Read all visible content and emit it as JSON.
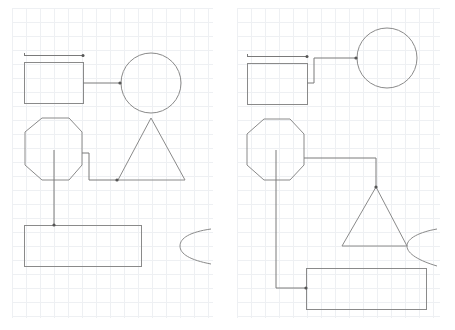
{
  "canvas": {
    "width": 455,
    "height": 330,
    "background": "#ffffff",
    "grid_color": "#eef0f3",
    "grid_spacing": 14,
    "stroke_color": "#8a8a8a"
  },
  "panels": [
    {
      "id": "left",
      "x": 0,
      "width": 227,
      "grid": {
        "x0": 12,
        "y0": 8,
        "x1": 213,
        "y1": 318
      },
      "shapes": [
        {
          "type": "line-marker",
          "name": "top-bar",
          "x1": 24,
          "y1": 55,
          "x2": 83,
          "y2": 55
        },
        {
          "type": "rect",
          "name": "rectangle-1",
          "x": 24,
          "y": 62,
          "w": 59,
          "h": 41
        },
        {
          "type": "circle",
          "name": "circle",
          "cx": 151,
          "cy": 83,
          "r": 30
        },
        {
          "type": "polygon",
          "name": "octagon",
          "points": "42,118 69,118 82,132 82,165 69,180 42,180 25,165 25,132"
        },
        {
          "type": "polygon",
          "name": "triangle",
          "points": "151,118 185,180 118,180"
        },
        {
          "type": "rect",
          "name": "rectangle-2",
          "x": 24,
          "y": 225,
          "w": 117,
          "h": 41
        },
        {
          "type": "arc",
          "name": "ellipse-partial",
          "d": "M211,229 C190,232 180,238 180,246 C180,254 190,260 211,264"
        }
      ],
      "edges": [
        {
          "name": "rect-to-circle",
          "d": "M83,83 L120,83",
          "arrow": [
            120,
            83
          ]
        },
        {
          "name": "octagon-to-triangle",
          "d": "M82,153 L89,153 L89,180 L117,180",
          "arrow": [
            117,
            180
          ]
        },
        {
          "name": "octagon-to-rect2",
          "d": "M54,150 L54,225",
          "arrow": [
            54,
            225
          ]
        }
      ]
    },
    {
      "id": "right",
      "x": 227,
      "width": 228,
      "grid": {
        "x0": 237,
        "y0": 8,
        "x1": 440,
        "y1": 318
      },
      "shapes": [
        {
          "type": "line-marker",
          "name": "top-bar",
          "x1": 247,
          "y1": 56,
          "x2": 307,
          "y2": 56
        },
        {
          "type": "rect",
          "name": "rectangle-1",
          "x": 247,
          "y": 63,
          "w": 60,
          "h": 41
        },
        {
          "type": "circle",
          "name": "circle",
          "cx": 387,
          "cy": 58,
          "r": 30
        },
        {
          "type": "polygon",
          "name": "octagon",
          "points": "264,119 290,119 304,134 304,165 290,180 264,180 247,165 247,134"
        },
        {
          "type": "polygon",
          "name": "triangle",
          "points": "376,187 407,246 342,246"
        },
        {
          "type": "rect",
          "name": "rectangle-2",
          "x": 306,
          "y": 268,
          "w": 120,
          "h": 41
        },
        {
          "type": "arc",
          "name": "ellipse-partial",
          "d": "M437,229 C420,232 407,238 407,246 C407,254 420,261 437,266"
        }
      ],
      "edges": [
        {
          "name": "rect-to-circle",
          "d": "M307,83 L314,83 L314,58 L356,58",
          "arrow": [
            356,
            58
          ]
        },
        {
          "name": "octagon-to-triangle",
          "d": "M304,158 L376,158 L376,187",
          "arrow": [
            376,
            187
          ]
        },
        {
          "name": "octagon-to-rect2",
          "d": "M276,150 L276,288 L306,288",
          "arrow": [
            306,
            288
          ]
        }
      ]
    }
  ]
}
